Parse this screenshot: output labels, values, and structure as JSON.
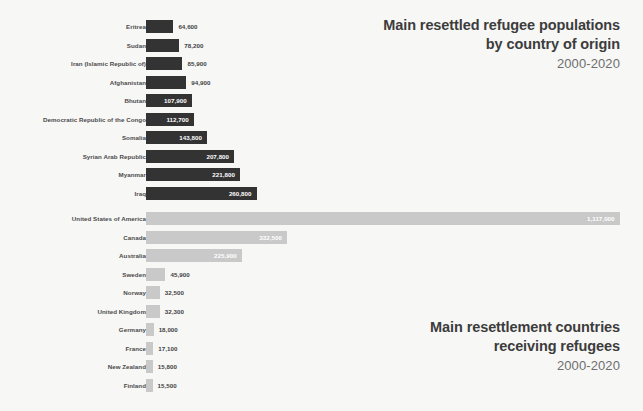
{
  "colors": {
    "background": "#f7f7f6",
    "bar_dark": "#333333",
    "bar_light": "#c9c9c9",
    "label_text": "#4b4b4b",
    "title_text": "#3c3c3c",
    "subtitle_text": "#6e6e6e",
    "value_inside_text": "#ffffff",
    "value_outside_text": "#3f3f3f"
  },
  "top": {
    "title_line1": "Main resettled refugee populations",
    "title_line2": "by country of origin",
    "subtitle": "2000-2020"
  },
  "bottom": {
    "title_line1": "Main resettlement countries",
    "title_line2": "receiving refugees",
    "subtitle": "2000-2020"
  },
  "chart_data": [
    {
      "type": "bar",
      "id": "origin-countries",
      "title": "Main resettled refugee populations by country of origin",
      "subtitle": "2000-2020",
      "orientation": "horizontal",
      "grid": false,
      "legend": null,
      "xlabel": "",
      "ylabel": "",
      "xlim": [
        0,
        1117000
      ],
      "bar_color": "#333333",
      "label_style": "inside-right-white",
      "categories": [
        "Eritrea",
        "Sudan",
        "Iran (Islamic Republic of)",
        "Afghanistan",
        "Bhutan",
        "Democratic Republic of the Congo",
        "Somalia",
        "Syrian Arab Republic",
        "Myanmar",
        "Iraq"
      ],
      "values": [
        64600,
        78200,
        85900,
        94900,
        107900,
        112700,
        143800,
        207800,
        221800,
        260800
      ],
      "value_labels": [
        "64,600",
        "78,200",
        "85,900",
        "94,900",
        "107,900",
        "112,700",
        "143,800",
        "207,800",
        "221,800",
        "260,800"
      ]
    },
    {
      "type": "bar",
      "id": "resettlement-countries",
      "title": "Main resettlement countries receiving refugees",
      "subtitle": "2000-2020",
      "orientation": "horizontal",
      "grid": false,
      "legend": null,
      "xlabel": "",
      "ylabel": "",
      "xlim": [
        0,
        1117000
      ],
      "bar_color": "#c9c9c9",
      "label_style": "mixed",
      "categories": [
        "United States of America",
        "Canada",
        "Australia",
        "Sweden",
        "Norway",
        "United Kingdom",
        "Germany",
        "France",
        "New Zealand",
        "Finland"
      ],
      "values": [
        1117000,
        332500,
        225900,
        45900,
        32500,
        32300,
        18000,
        17100,
        15800,
        15500
      ],
      "value_labels": [
        "1,117,000",
        "332,500",
        "225,900",
        "45,900",
        "32,500",
        "32,300",
        "18,000",
        "17,100",
        "15,800",
        "15,500"
      ]
    }
  ]
}
